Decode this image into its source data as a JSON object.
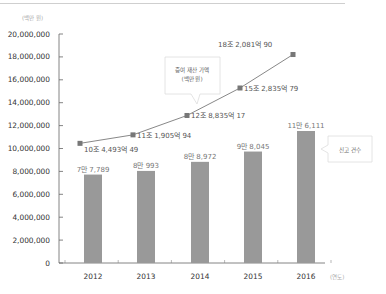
{
  "chart_data": {
    "type": "bar+line",
    "title": "",
    "ylabel_unit": "(백만 원)",
    "xlabel_unit": "(연도)",
    "categories": [
      "2012",
      "2013",
      "2014",
      "2015",
      "2016"
    ],
    "y_ticks": [
      "20,000,000",
      "18,000,000",
      "16,000,000",
      "14,000,000",
      "12,000,000",
      "10,000,000",
      "8,000,000",
      "6,000,000",
      "4,000,000",
      "2,000,000",
      "0"
    ],
    "ylim": [
      0,
      20000000
    ],
    "grid": false,
    "series": [
      {
        "name": "신고 건수",
        "type": "bar",
        "values": [
          77789,
          80993,
          88972,
          98045,
          116111
        ],
        "labels": [
          "7만 7,789",
          "8만 993",
          "8만 8,972",
          "9만 8,045",
          "11만 6,111"
        ],
        "color": "#999999"
      },
      {
        "name": "증여 재산 가액 (백만 원)",
        "type": "line",
        "values": [
          10449349,
          11190594,
          12883517,
          15283579,
          18208190
        ],
        "labels": [
          "10조 4,493억 49",
          "11조 1,905억 94",
          "12조 8,835억 17",
          "15조 2,835억 79",
          "18조 2,081억 90"
        ],
        "color": "#888888"
      }
    ],
    "annotations": [
      {
        "text_line1": "증여 재산 가액",
        "text_line2": "(백만 원)",
        "target": "line"
      },
      {
        "text_line1": "신고 건수",
        "target": "bar"
      }
    ]
  }
}
